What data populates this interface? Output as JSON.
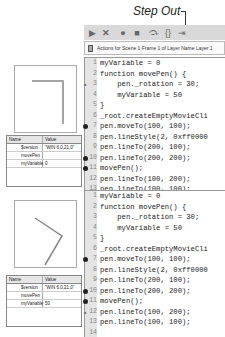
{
  "callout": {
    "label": "Step Out"
  },
  "toolbar": {
    "icons": [
      "continue-icon",
      "stop-debugging-icon",
      "toggle-breakpoint-icon",
      "remove-breakpoints-icon",
      "step-over-icon",
      "step-in-icon",
      "step-out-icon"
    ]
  },
  "actions_bar": {
    "title": "Actions for Scene 1 Frame 1 of Layer Name Layer 1"
  },
  "editors": [
    {
      "lines": [
        {
          "n": "1",
          "code": "myVariable = 0",
          "marker": ""
        },
        {
          "n": "2",
          "code": "function movePen() {",
          "marker": ""
        },
        {
          "n": "3",
          "code": "    pen._rotation = 30;",
          "marker": "arrow"
        },
        {
          "n": "4",
          "code": "    myVariable = 50",
          "marker": ""
        },
        {
          "n": "5",
          "code": "}",
          "marker": ""
        },
        {
          "n": "6",
          "code": "_root.createEmptyMovieCli",
          "marker": ""
        },
        {
          "n": "7",
          "code": "pen.moveTo(100, 100);",
          "marker": "breakpoint"
        },
        {
          "n": "8",
          "code": "pen.lineStyle(2, 0xff0000",
          "marker": ""
        },
        {
          "n": "9",
          "code": "pen.lineTo(200, 100);",
          "marker": ""
        },
        {
          "n": "10",
          "code": "pen.lineTo(200, 200);",
          "marker": "breakpoint"
        },
        {
          "n": "11",
          "code": "movePen();",
          "marker": "breakpoint"
        },
        {
          "n": "12",
          "code": "pen.lineTo(100, 200);",
          "marker": ""
        },
        {
          "n": "13",
          "code": "pen.lineTo(100, 100);",
          "marker": ""
        },
        {
          "n": "14",
          "code": "",
          "marker": ""
        }
      ]
    },
    {
      "lines": [
        {
          "n": "1",
          "code": "myVariable = 0",
          "marker": ""
        },
        {
          "n": "2",
          "code": "function movePen() {",
          "marker": ""
        },
        {
          "n": "3",
          "code": "    pen._rotation = 30;",
          "marker": ""
        },
        {
          "n": "4",
          "code": "    myVariable = 50",
          "marker": ""
        },
        {
          "n": "5",
          "code": "}",
          "marker": ""
        },
        {
          "n": "6",
          "code": "_root.createEmptyMovieCli",
          "marker": ""
        },
        {
          "n": "7",
          "code": "pen.moveTo(100, 100);",
          "marker": "breakpoint"
        },
        {
          "n": "8",
          "code": "pen.lineStyle(2, 0xff0000",
          "marker": ""
        },
        {
          "n": "9",
          "code": "pen.lineTo(200, 100);",
          "marker": ""
        },
        {
          "n": "10",
          "code": "pen.lineTo(200, 200);",
          "marker": "breakpoint"
        },
        {
          "n": "11",
          "code": "movePen();",
          "marker": "breakpoint"
        },
        {
          "n": "12",
          "code": "pen.lineTo(100, 200);",
          "marker": "arrow"
        },
        {
          "n": "13",
          "code": "pen.lineTo(100, 100);",
          "marker": ""
        },
        {
          "n": "14",
          "code": "",
          "marker": ""
        }
      ]
    }
  ],
  "variables": [
    {
      "headers": {
        "name": "Name",
        "value": "Value"
      },
      "rows": [
        {
          "name": "$version",
          "value": "\"WIN 6,0,21,0\""
        },
        {
          "name": "movePen",
          "value": ""
        },
        {
          "name": "myVariable",
          "value": "0"
        }
      ]
    },
    {
      "headers": {
        "name": "Name",
        "value": "Value"
      },
      "rows": [
        {
          "name": "$version",
          "value": "\"WIN 6,0,21,0\""
        },
        {
          "name": "movePen",
          "value": ""
        },
        {
          "name": "myVariable",
          "value": "50"
        }
      ]
    }
  ]
}
